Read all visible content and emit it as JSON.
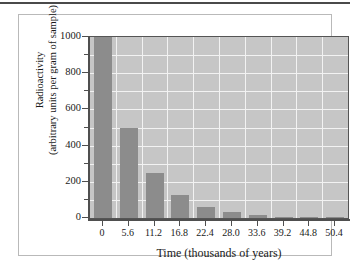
{
  "chart_data": {
    "type": "bar",
    "title": "",
    "xlabel": "Time (thousands of years)",
    "ylabel": "Radioactivity\n(arbitrary units per gram of sample)",
    "ylabel_line1": "Radioactivity",
    "ylabel_line2": "(arbitrary units per gram of sample)",
    "categories": [
      "0",
      "5.6",
      "11.2",
      "16.8",
      "22.4",
      "28.0",
      "33.6",
      "39.2",
      "44.8",
      "50.4"
    ],
    "values": [
      1000,
      500,
      250,
      125,
      62.5,
      31.25,
      15.6,
      7.8,
      3.9,
      2
    ],
    "ylim": [
      0,
      1000
    ],
    "xlim": [
      0,
      50.4
    ],
    "ytick_labels": [
      "1000",
      "800",
      "600",
      "400",
      "200",
      "0"
    ],
    "ytick_values": [
      1000,
      800,
      600,
      400,
      200,
      0
    ],
    "yminor_values": [
      900,
      700,
      500,
      300,
      100
    ],
    "grid": true,
    "grid_color": "#f2f2f2",
    "legend": "none",
    "bar_color": "#8c8c8c",
    "plot_background": "#c6c6c6",
    "axis_color": "#4f4f4f"
  }
}
